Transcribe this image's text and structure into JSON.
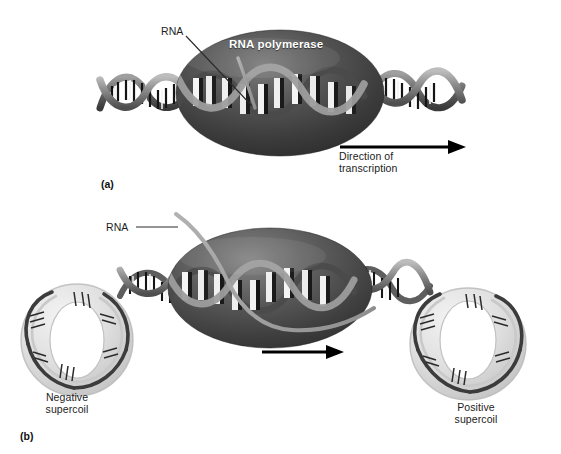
{
  "figure": {
    "background_color": "#ffffff"
  },
  "panel_a": {
    "key": "(a)",
    "labels": {
      "rna": "RNA",
      "rna_polymerase": "RNA polymerase",
      "direction_line1": "Direction of",
      "direction_line2": "transcription"
    },
    "elements": {
      "polymerase_shape": "ellipse",
      "polymerase_fill_dark": "#343434",
      "polymerase_fill_light": "#6a6a6a",
      "dna_backbone_color": "#8c8c8c",
      "dna_rung_color": "#1a1a1a",
      "rna_strand_color": "#9a9a9a",
      "arrow_color": "#000000",
      "arrow_direction": "right"
    }
  },
  "panel_b": {
    "key": "(b)",
    "labels": {
      "rna": "RNA",
      "negative_supercoil_line1": "Negative",
      "negative_supercoil_line2": "supercoil",
      "positive_supercoil_line1": "Positive",
      "positive_supercoil_line2": "supercoil"
    },
    "elements": {
      "polymerase_shape": "ellipse",
      "polymerase_fill_dark": "#3b3b3b",
      "polymerase_fill_light": "#6f6f6f",
      "left_loop": "negative-supercoil-toroid",
      "right_loop": "positive-supercoil-toroid",
      "loop_fill_color": "#d4d4d4",
      "dna_backbone_color": "#5a5a5a",
      "arrow_color": "#000000",
      "arrow_direction": "right"
    }
  }
}
